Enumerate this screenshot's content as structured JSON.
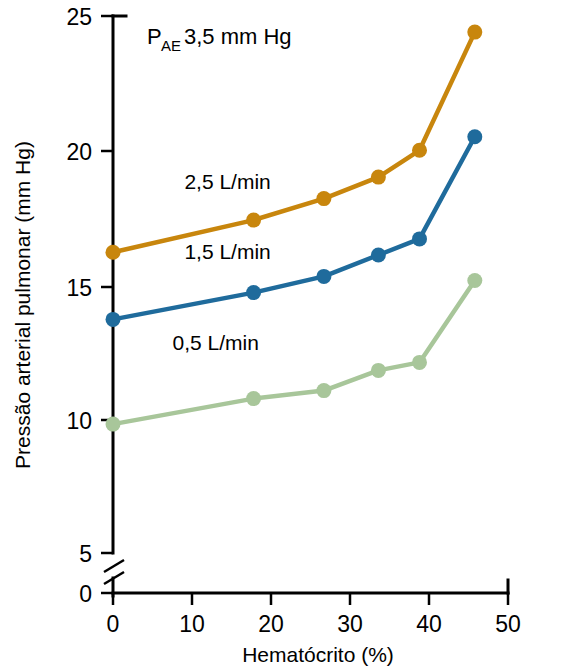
{
  "chart_data": {
    "type": "line",
    "title": "",
    "xlabel": "Hematócrito (%)",
    "ylabel": "Pressão arterial pulmonar (mm Hg)",
    "xlim": [
      0,
      50
    ],
    "ylim": [
      0,
      25
    ],
    "y_axis_break": true,
    "y_break_between": [
      0,
      5
    ],
    "xticks": [
      0,
      10,
      20,
      30,
      40,
      50
    ],
    "xtick_labels": [
      "0",
      "10",
      "20",
      "30",
      "40",
      "50"
    ],
    "yticks": [
      0,
      5,
      10,
      15,
      20,
      25
    ],
    "ytick_labels": [
      "0",
      "5",
      "10",
      "15",
      "20",
      "25"
    ],
    "grid": false,
    "legend_position": "inline-labels",
    "annotations": [
      {
        "name": "pae-annotation",
        "text_main": "P",
        "text_sub": "AE",
        "text_rest": " 3,5 mm Hg",
        "full_text": "PAE 3,5 mm Hg",
        "x": 10,
        "y": 23.6
      }
    ],
    "x": [
      0,
      17.8,
      26.7,
      33.6,
      38.8,
      45.8
    ],
    "series": [
      {
        "name": "2,5 L/min",
        "color": "#c8860d",
        "values": [
          16.2,
          17.4,
          18.2,
          19.0,
          20.0,
          24.4
        ],
        "label_x": 14.5,
        "label_y": 18.55
      },
      {
        "name": "1,5 L/min",
        "color": "#1f6b9c",
        "values": [
          13.7,
          14.7,
          15.3,
          16.1,
          16.7,
          20.5
        ],
        "label_x": 14.5,
        "label_y": 15.95
      },
      {
        "name": "0,5 L/min",
        "color": "#a8c69a",
        "values": [
          9.8,
          10.75,
          11.05,
          11.8,
          12.1,
          15.15
        ],
        "label_x": 13.0,
        "label_y": 12.55
      }
    ]
  }
}
